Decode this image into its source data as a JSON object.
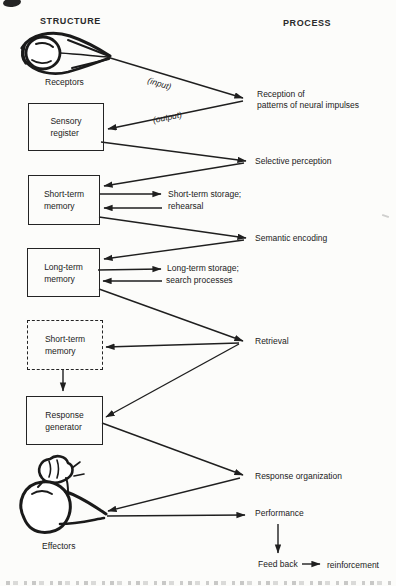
{
  "colors": {
    "paper": "#fcfcfa",
    "ink": "#1f1f1f"
  },
  "headers": {
    "structure": "STRUCTURE",
    "process": "PROCESS"
  },
  "structure": {
    "receptors_caption": "Receptors",
    "effectors_caption": "Effectors",
    "boxes": [
      {
        "line1": "Sensory",
        "line2": "register",
        "border": "solid"
      },
      {
        "line1": "Short-term",
        "line2": "memory",
        "border": "solid"
      },
      {
        "line1": "Long-term",
        "line2": "memory",
        "border": "solid"
      },
      {
        "line1": "Short-term",
        "line2": "memory",
        "border": "dashed"
      },
      {
        "line1": "Response",
        "line2": "generator",
        "border": "solid"
      }
    ]
  },
  "process": {
    "reception_line1": "Reception of",
    "reception_line2": "patterns of neural impulses",
    "selective_perception": "Selective perception",
    "semantic_encoding": "Semantic encoding",
    "retrieval": "Retrieval",
    "response_organization": "Response organization",
    "performance": "Performance",
    "feedback": "Feed back",
    "reinforcement": "reinforcement"
  },
  "flow_labels": {
    "input": "(input)",
    "output": "(output)",
    "short_term_storage": "Short-term storage;",
    "rehearsal": "rehearsal",
    "long_term_storage": "Long-term storage;",
    "search_processes": "search processes"
  },
  "illustrations": {
    "receptors": "eye-sketch-icon",
    "effectors": "flexed-arm-sketch-icon"
  },
  "connections": [
    {
      "from": "receptors",
      "to": "reception-of-neural-impulses",
      "label": "(input)"
    },
    {
      "from": "reception-of-neural-impulses",
      "to": "sensory-register",
      "label": "(output)"
    },
    {
      "from": "sensory-register",
      "to": "selective-perception"
    },
    {
      "from": "selective-perception",
      "to": "short-term-memory"
    },
    {
      "from": "short-term-memory",
      "to": "short-term-storage-rehearsal"
    },
    {
      "from": "short-term-storage-rehearsal",
      "to": "short-term-memory"
    },
    {
      "from": "short-term-memory",
      "to": "semantic-encoding"
    },
    {
      "from": "semantic-encoding",
      "to": "long-term-memory"
    },
    {
      "from": "long-term-memory",
      "to": "long-term-storage-search"
    },
    {
      "from": "long-term-storage-search",
      "to": "long-term-memory"
    },
    {
      "from": "long-term-memory",
      "to": "retrieval"
    },
    {
      "from": "retrieval",
      "to": "short-term-memory-dashed"
    },
    {
      "from": "retrieval",
      "to": "response-generator"
    },
    {
      "from": "short-term-memory-dashed",
      "to": "response-generator"
    },
    {
      "from": "response-generator",
      "to": "response-organization"
    },
    {
      "from": "response-organization",
      "to": "effectors"
    },
    {
      "from": "effectors",
      "to": "performance"
    },
    {
      "from": "performance",
      "to": "feedback"
    },
    {
      "from": "feedback",
      "to": "reinforcement"
    }
  ]
}
